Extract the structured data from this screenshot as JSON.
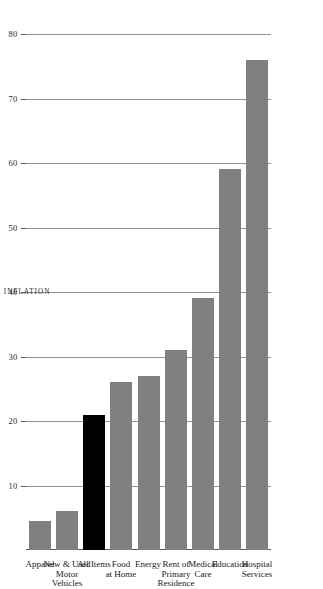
{
  "chart_data": {
    "type": "bar",
    "orientation": "horizontal",
    "title": "",
    "subtitle": "",
    "xlabel": "TEN-YEAR CUMULATIVE INFLATION",
    "ylabel": "",
    "categories": [
      "Hospital Services",
      "Education",
      "Medical Care",
      "Rent of Primary Residence",
      "Energy",
      "Food at Home",
      "All Items",
      "New & Used Motor Vehicles",
      "Apparel"
    ],
    "values": [
      76,
      59,
      39,
      31,
      27,
      26,
      21,
      6,
      4.5
    ],
    "xlim": [
      0,
      80
    ],
    "ticks": [
      80,
      70,
      60,
      50,
      40,
      30,
      20,
      10
    ],
    "tick_labels": [
      "80",
      "70",
      "60",
      "50",
      "40",
      "30",
      "20",
      "10"
    ],
    "grid": true,
    "legend": "none",
    "bar_colors": [
      "#808080",
      "#808080",
      "#808080",
      "#808080",
      "#808080",
      "#808080",
      "#000000",
      "#808080",
      "#808080"
    ],
    "highlight_category": "All Items",
    "colors": {
      "bar_default": "#808080",
      "bar_highlight": "#000000",
      "gridline": "#8f9499",
      "axis": "#555a5e",
      "background": "#ffffff",
      "text": "#2a2a2a"
    },
    "category_label_lines": [
      [
        "Hospital",
        "Services"
      ],
      [
        "Education"
      ],
      [
        "Medical",
        "Care"
      ],
      [
        "Rent of",
        "Primary",
        "Residence"
      ],
      [
        "Energy"
      ],
      [
        "Food",
        "at Home"
      ],
      [
        "All Items"
      ],
      [
        "New & Used",
        "Motor",
        "Vehicles"
      ],
      [
        "Apparel"
      ]
    ]
  }
}
